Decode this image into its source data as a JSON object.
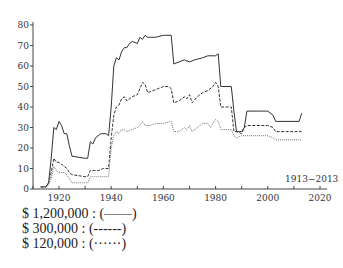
{
  "chart_data": {
    "type": "line",
    "title": "",
    "annotation": "1913−2013",
    "xlabel": "",
    "ylabel": "",
    "xlim": [
      1910,
      2022
    ],
    "ylim": [
      0,
      80
    ],
    "x_ticks": [
      1920,
      1940,
      1960,
      1980,
      2000,
      2020
    ],
    "y_ticks": [
      0,
      10,
      20,
      30,
      40,
      50,
      60,
      70,
      80
    ],
    "grid": false,
    "legend_position": "below",
    "series": [
      {
        "name": "$ 1,200,000",
        "style": "solid",
        "points": [
          [
            1913,
            1
          ],
          [
            1915,
            1
          ],
          [
            1916,
            3
          ],
          [
            1917,
            15
          ],
          [
            1918,
            30
          ],
          [
            1919,
            29
          ],
          [
            1920,
            33
          ],
          [
            1921,
            31
          ],
          [
            1922,
            27
          ],
          [
            1923,
            27
          ],
          [
            1924,
            21
          ],
          [
            1925,
            16
          ],
          [
            1930,
            15
          ],
          [
            1931,
            15
          ],
          [
            1932,
            23
          ],
          [
            1933,
            22
          ],
          [
            1934,
            25
          ],
          [
            1936,
            27
          ],
          [
            1938,
            27
          ],
          [
            1939,
            26
          ],
          [
            1940,
            40
          ],
          [
            1941,
            60
          ],
          [
            1942,
            64
          ],
          [
            1943,
            63
          ],
          [
            1944,
            67
          ],
          [
            1945,
            69
          ],
          [
            1946,
            69
          ],
          [
            1947,
            71
          ],
          [
            1948,
            72
          ],
          [
            1950,
            71
          ],
          [
            1951,
            74
          ],
          [
            1952,
            73
          ],
          [
            1953,
            75
          ],
          [
            1954,
            74
          ],
          [
            1955,
            74
          ],
          [
            1957,
            74
          ],
          [
            1960,
            75
          ],
          [
            1963,
            75
          ],
          [
            1964,
            61
          ],
          [
            1966,
            62
          ],
          [
            1968,
            63
          ],
          [
            1970,
            62
          ],
          [
            1972,
            63
          ],
          [
            1975,
            64
          ],
          [
            1977,
            65
          ],
          [
            1980,
            65
          ],
          [
            1981,
            66
          ],
          [
            1982,
            50
          ],
          [
            1986,
            50
          ],
          [
            1987,
            38
          ],
          [
            1988,
            28
          ],
          [
            1990,
            28
          ],
          [
            1991,
            30
          ],
          [
            1992,
            38
          ],
          [
            1996,
            38
          ],
          [
            2000,
            38
          ],
          [
            2002,
            36
          ],
          [
            2003,
            33
          ],
          [
            2012,
            33
          ],
          [
            2013,
            37
          ]
        ]
      },
      {
        "name": "$ 300,000",
        "style": "dashed",
        "points": [
          [
            1913,
            1
          ],
          [
            1915,
            1
          ],
          [
            1916,
            3
          ],
          [
            1917,
            8
          ],
          [
            1918,
            15
          ],
          [
            1919,
            13
          ],
          [
            1920,
            13
          ],
          [
            1921,
            12
          ],
          [
            1922,
            11
          ],
          [
            1923,
            10
          ],
          [
            1924,
            8
          ],
          [
            1925,
            7
          ],
          [
            1930,
            6
          ],
          [
            1931,
            6
          ],
          [
            1932,
            9
          ],
          [
            1935,
            9
          ],
          [
            1937,
            10
          ],
          [
            1939,
            10
          ],
          [
            1940,
            25
          ],
          [
            1941,
            36
          ],
          [
            1942,
            40
          ],
          [
            1943,
            41
          ],
          [
            1944,
            44
          ],
          [
            1945,
            45
          ],
          [
            1946,
            43
          ],
          [
            1948,
            45
          ],
          [
            1950,
            46
          ],
          [
            1951,
            49
          ],
          [
            1952,
            52
          ],
          [
            1953,
            51
          ],
          [
            1954,
            47
          ],
          [
            1956,
            48
          ],
          [
            1958,
            49
          ],
          [
            1960,
            50
          ],
          [
            1962,
            50
          ],
          [
            1963,
            49
          ],
          [
            1964,
            42
          ],
          [
            1966,
            43
          ],
          [
            1968,
            45
          ],
          [
            1969,
            44
          ],
          [
            1970,
            46
          ],
          [
            1971,
            42
          ],
          [
            1973,
            45
          ],
          [
            1975,
            47
          ],
          [
            1977,
            48
          ],
          [
            1979,
            50
          ],
          [
            1980,
            52
          ],
          [
            1981,
            50
          ],
          [
            1982,
            40
          ],
          [
            1986,
            40
          ],
          [
            1987,
            28
          ],
          [
            1988,
            28
          ],
          [
            1990,
            27
          ],
          [
            1991,
            30
          ],
          [
            1992,
            31
          ],
          [
            2000,
            31
          ],
          [
            2002,
            30
          ],
          [
            2003,
            28
          ],
          [
            2013,
            28
          ]
        ]
      },
      {
        "name": "$ 120,000",
        "style": "dotted",
        "points": [
          [
            1913,
            1
          ],
          [
            1915,
            1
          ],
          [
            1916,
            2
          ],
          [
            1917,
            5
          ],
          [
            1918,
            11
          ],
          [
            1919,
            9
          ],
          [
            1920,
            8
          ],
          [
            1922,
            8
          ],
          [
            1923,
            7
          ],
          [
            1924,
            5
          ],
          [
            1925,
            3
          ],
          [
            1930,
            3
          ],
          [
            1931,
            3
          ],
          [
            1932,
            6
          ],
          [
            1935,
            6
          ],
          [
            1937,
            6
          ],
          [
            1939,
            6
          ],
          [
            1940,
            20
          ],
          [
            1941,
            26
          ],
          [
            1942,
            28
          ],
          [
            1943,
            27
          ],
          [
            1944,
            29
          ],
          [
            1945,
            29
          ],
          [
            1946,
            28
          ],
          [
            1948,
            29
          ],
          [
            1950,
            30
          ],
          [
            1951,
            31
          ],
          [
            1952,
            33
          ],
          [
            1953,
            31
          ],
          [
            1955,
            31
          ],
          [
            1957,
            32
          ],
          [
            1960,
            32
          ],
          [
            1963,
            33
          ],
          [
            1964,
            28
          ],
          [
            1966,
            28
          ],
          [
            1968,
            30
          ],
          [
            1969,
            29
          ],
          [
            1970,
            31
          ],
          [
            1971,
            28
          ],
          [
            1973,
            30
          ],
          [
            1975,
            32
          ],
          [
            1977,
            32
          ],
          [
            1978,
            30
          ],
          [
            1980,
            34
          ],
          [
            1981,
            33
          ],
          [
            1982,
            29
          ],
          [
            1986,
            29
          ],
          [
            1987,
            26
          ],
          [
            1988,
            25
          ],
          [
            1990,
            26
          ],
          [
            1991,
            26
          ],
          [
            2000,
            26
          ],
          [
            2002,
            25
          ],
          [
            2003,
            24
          ],
          [
            2013,
            24
          ]
        ]
      }
    ]
  },
  "legend": {
    "items": [
      {
        "label": "$ 1,200,000 : (——)",
        "style": "solid"
      },
      {
        "label": "$ 300,000 : (------)",
        "style": "dashed"
      },
      {
        "label": "$ 120,000 : (······)",
        "style": "dotted"
      }
    ]
  }
}
